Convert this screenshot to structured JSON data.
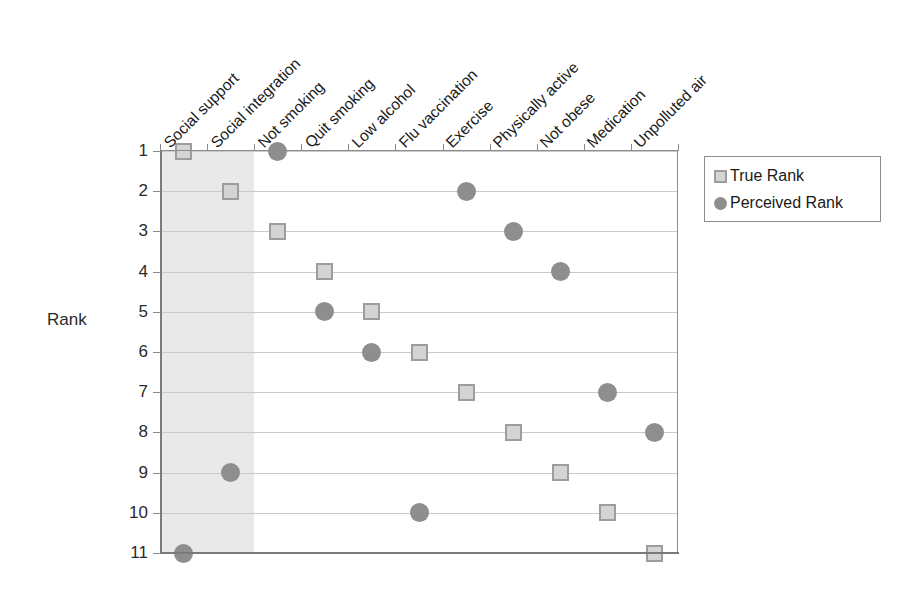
{
  "chart_data": {
    "type": "scatter",
    "title": "",
    "xlabel": "",
    "ylabel": "Rank",
    "ylim": [
      1,
      11
    ],
    "y_ticks": [
      "1",
      "2",
      "3",
      "4",
      "5",
      "6",
      "7",
      "8",
      "9",
      "10",
      "11"
    ],
    "grid": true,
    "legend_position": "right",
    "categories": [
      "Social support",
      "Social integration",
      "Not smoking",
      "Quit smoking",
      "Low alcohol",
      "Flu vaccination",
      "Exercise",
      "Physically active",
      "Not obese",
      "Medication",
      "Unpolluted air"
    ],
    "series": [
      {
        "name": "True Rank",
        "marker": "square",
        "color": "#d4d4d4",
        "values": [
          1,
          2,
          3,
          4,
          5,
          6,
          7,
          8,
          9,
          10,
          11
        ]
      },
      {
        "name": "Perceived Rank",
        "marker": "circle",
        "color": "#8e8e8e",
        "values": [
          11,
          9,
          1,
          5,
          6,
          10,
          2,
          3,
          4,
          7,
          8
        ]
      }
    ],
    "highlight_band": {
      "label": "shaded region",
      "from_category": "Social support",
      "to_category": "Social integration",
      "color": "#e9e9e9"
    }
  },
  "legend": {
    "items": [
      {
        "label": "True Rank",
        "marker": "square"
      },
      {
        "label": "Perceived Rank",
        "marker": "circle"
      }
    ]
  }
}
